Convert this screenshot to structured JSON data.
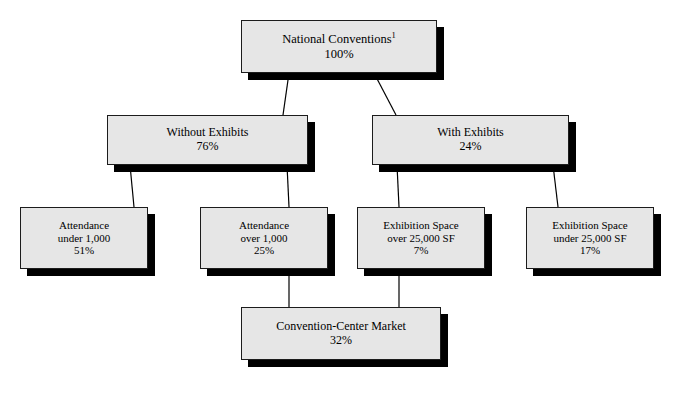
{
  "diagram": {
    "colors": {
      "box_fill": "#e6e6e6",
      "box_border": "#1c1c1c",
      "shadow": "#000000",
      "connector": "#000000",
      "background": "#ffffff",
      "text": "#000000"
    },
    "nodes": [
      {
        "id": "national-conventions",
        "level": 1,
        "lines": [
          "National Conventions",
          "100%"
        ],
        "label": "National Conventions",
        "footnote": "1",
        "value": "100%",
        "x": 241,
        "y": 20,
        "width": 196,
        "height": 53
      },
      {
        "id": "without-exhibits",
        "level": 2,
        "lines": [
          "Without Exhibits",
          "76%"
        ],
        "label": "Without Exhibits",
        "value": "76%",
        "x": 107,
        "y": 115,
        "width": 201,
        "height": 50
      },
      {
        "id": "with-exhibits",
        "level": 2,
        "lines": [
          "With Exhibits",
          "24%"
        ],
        "label": "With Exhibits",
        "value": "24%",
        "x": 372,
        "y": 115,
        "width": 197,
        "height": 50
      },
      {
        "id": "attendance-under-1000",
        "level": 3,
        "lines": [
          "Attendance",
          "under 1,000",
          "51%"
        ],
        "label": "Attendance under 1,000",
        "value": "51%",
        "x": 20,
        "y": 207,
        "width": 128,
        "height": 62
      },
      {
        "id": "attendance-over-1000",
        "level": 3,
        "lines": [
          "Attendance",
          "over 1,000",
          "25%"
        ],
        "label": "Attendance over 1,000",
        "value": "25%",
        "x": 200,
        "y": 207,
        "width": 128,
        "height": 62
      },
      {
        "id": "exhibition-space-over-25000",
        "level": 3,
        "lines": [
          "Exhibition Space",
          "over 25,000 SF",
          "7%"
        ],
        "label": "Exhibition Space over 25,000 SF",
        "value": "7%",
        "x": 357,
        "y": 207,
        "width": 128,
        "height": 62
      },
      {
        "id": "exhibition-space-under-25000",
        "level": 3,
        "lines": [
          "Exhibition Space",
          "under 25,000 SF",
          "17%"
        ],
        "label": "Exhibition Space under 25,000 SF",
        "value": "17%",
        "x": 526,
        "y": 207,
        "width": 128,
        "height": 62
      },
      {
        "id": "convention-center-market",
        "level": 4,
        "lines": [
          "Convention-Center Market",
          "32%"
        ],
        "label": "Convention-Center Market",
        "value": "32%",
        "x": 241,
        "y": 307,
        "width": 200,
        "height": 53
      }
    ],
    "connectors": [
      {
        "id": "national-to-without",
        "from": "national-conventions",
        "to": "without-exhibits",
        "x1": 289,
        "y1": 73,
        "x2": 283,
        "y2": 115
      },
      {
        "id": "national-to-with",
        "from": "national-conventions",
        "to": "with-exhibits",
        "x1": 374,
        "y1": 73,
        "x2": 396,
        "y2": 115
      },
      {
        "id": "without-to-attendance-under",
        "from": "without-exhibits",
        "to": "attendance-under-1000",
        "x1": 130,
        "y1": 165,
        "x2": 134,
        "y2": 207
      },
      {
        "id": "without-to-attendance-over",
        "from": "without-exhibits",
        "to": "attendance-over-1000",
        "x1": 287,
        "y1": 165,
        "x2": 289,
        "y2": 207
      },
      {
        "id": "with-to-exhibition-over",
        "from": "with-exhibits",
        "to": "exhibition-space-over-25000",
        "x1": 397,
        "y1": 165,
        "x2": 399,
        "y2": 207
      },
      {
        "id": "with-to-exhibition-under",
        "from": "with-exhibits",
        "to": "exhibition-space-under-25000",
        "x1": 553,
        "y1": 165,
        "x2": 558,
        "y2": 207
      },
      {
        "id": "attendance-over-to-market",
        "from": "attendance-over-1000",
        "to": "convention-center-market",
        "x1": 289,
        "y1": 269,
        "x2": 289,
        "y2": 307
      },
      {
        "id": "exhibition-over-to-market",
        "from": "exhibition-space-over-25000",
        "to": "convention-center-market",
        "x1": 399,
        "y1": 269,
        "x2": 399,
        "y2": 307
      }
    ]
  }
}
